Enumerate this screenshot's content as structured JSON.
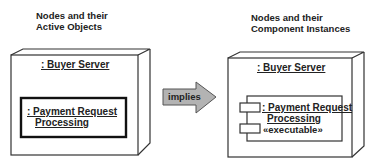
{
  "left_panel": {
    "title_line1": "Nodes and their",
    "title_line2": "Active Objects",
    "node": {
      "label": ": Buyer Server"
    },
    "active_object": {
      "label_line1": ": Payment Request",
      "label_line2": "Processing"
    }
  },
  "arrow": {
    "label": "implies",
    "fill": "#b0b0b0"
  },
  "right_panel": {
    "title_line1": "Nodes and their",
    "title_line2": "Component Instances",
    "node": {
      "label": ": Buyer Server"
    },
    "component": {
      "label_line1": ": Payment Request",
      "label_line2": "Processing",
      "stereotype": "«executable»"
    }
  }
}
